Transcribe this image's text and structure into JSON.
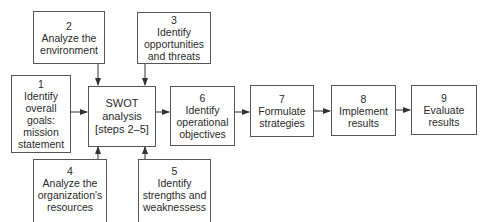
{
  "diagram": {
    "nodes": [
      {
        "id": "1",
        "number": "1",
        "lines": [
          "Identify",
          "overall",
          "goals:",
          "mission",
          "statement"
        ]
      },
      {
        "id": "2",
        "number": "2",
        "lines": [
          "Analyze the",
          "environment"
        ]
      },
      {
        "id": "3",
        "number": "3",
        "lines": [
          "Identify",
          "opportunities",
          "and threats"
        ]
      },
      {
        "id": "swot",
        "number": "",
        "lines": [
          "SWOT",
          "analysis",
          "[steps 2–5]"
        ]
      },
      {
        "id": "4",
        "number": "4",
        "lines": [
          "Analyze the",
          "organization's",
          "resources"
        ]
      },
      {
        "id": "5",
        "number": "5",
        "lines": [
          "Identify",
          "strengths and",
          "weaknessess"
        ]
      },
      {
        "id": "6",
        "number": "6",
        "lines": [
          "Identify",
          "operational",
          "objectives"
        ]
      },
      {
        "id": "7",
        "number": "7",
        "lines": [
          "Formulate",
          "strategies"
        ]
      },
      {
        "id": "8",
        "number": "8",
        "lines": [
          "Implement",
          "results"
        ]
      },
      {
        "id": "9",
        "number": "9",
        "lines": [
          "Evaluate",
          "results"
        ]
      }
    ],
    "edges": [
      {
        "from": "1",
        "to": "swot"
      },
      {
        "from": "2",
        "to": "swot"
      },
      {
        "from": "3",
        "to": "swot"
      },
      {
        "from": "4",
        "to": "swot"
      },
      {
        "from": "5",
        "to": "swot"
      },
      {
        "from": "swot",
        "to": "6"
      },
      {
        "from": "6",
        "to": "7"
      },
      {
        "from": "7",
        "to": "8"
      },
      {
        "from": "8",
        "to": "9"
      }
    ],
    "colors": {
      "line": "#333333",
      "border": "#555555",
      "text": "#2a2a2a"
    }
  }
}
